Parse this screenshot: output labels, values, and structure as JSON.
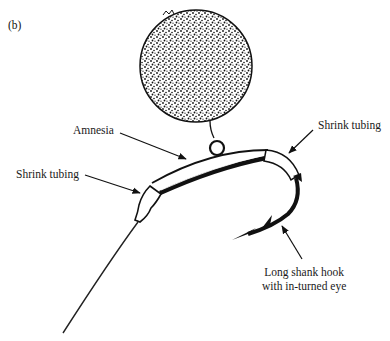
{
  "figure": {
    "panel_label": "(b)",
    "labels": {
      "amnesia": "Amnesia",
      "shrink_tubing_left": "Shrink tubing",
      "shrink_tubing_right": "Shrink tubing",
      "hook_line1": "Long shank hook",
      "hook_line2": "with in-turned eye"
    },
    "components": [
      "float-ball",
      "swivel-ring",
      "amnesia-line",
      "shrink-tubing-left",
      "shrink-tubing-right",
      "long-shank-hook",
      "leader-line"
    ],
    "colors": {
      "ink": "#111111",
      "background": "#ffffff"
    }
  }
}
